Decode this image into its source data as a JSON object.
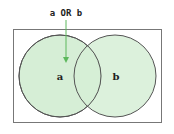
{
  "diagram": {
    "type": "venn",
    "title": "a OR b",
    "sets": [
      {
        "label": "a",
        "highlighted": true
      },
      {
        "label": "b",
        "highlighted": true
      }
    ],
    "colors": {
      "fill": "#d6eed6",
      "stroke": "#555555",
      "arrow": "#5cb85c",
      "border": "#777777"
    }
  }
}
